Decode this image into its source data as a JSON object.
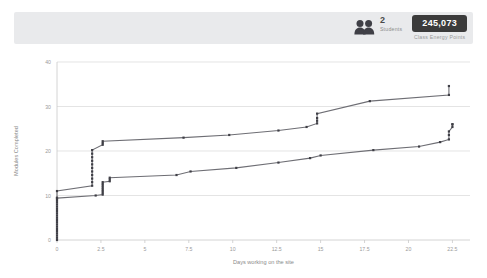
{
  "stats": {
    "students": {
      "value": "2",
      "label": "Students",
      "icon": "people-icon"
    },
    "energy_points": {
      "value": "245,073",
      "label": "Class Energy Points"
    }
  },
  "chart_data": {
    "type": "line",
    "title": "",
    "xlabel": "Days working on the site",
    "ylabel": "Modules Completed",
    "xlim": [
      0,
      23.5
    ],
    "ylim": [
      0,
      40
    ],
    "xticks": [
      "0",
      "2.5",
      "5",
      "7.5",
      "10",
      "12.5",
      "15",
      "17.5",
      "20",
      "22.5"
    ],
    "xtick_values": [
      0,
      2.5,
      5,
      7.5,
      10,
      12.5,
      15,
      17.5,
      20,
      22.5
    ],
    "yticks": [
      "0",
      "10",
      "20",
      "30",
      "40"
    ],
    "ytick_values": [
      0,
      10,
      20,
      30,
      40
    ],
    "grid": true,
    "legend": "none",
    "line_color": "#6e6e74",
    "marker_color": "#3f3f46",
    "series": [
      {
        "name": "Student 1",
        "x": [
          0,
          0,
          0,
          0,
          0,
          0,
          0,
          0,
          0,
          0,
          0,
          0,
          0,
          0,
          0,
          0,
          0,
          0,
          0,
          0,
          0,
          2.0,
          2.0,
          2.0,
          2.0,
          2.0,
          2.0,
          2.0,
          2.0,
          2.0,
          2.0,
          2.0,
          2.6,
          2.6,
          2.6,
          7.2,
          9.8,
          12.6,
          14.2,
          14.8,
          14.8,
          14.8,
          14.8,
          17.8,
          22.3
        ],
        "y": [
          0,
          0.5,
          1,
          1.5,
          2,
          2.5,
          3,
          3.5,
          4,
          4.5,
          5,
          5.5,
          6,
          6.5,
          7,
          7.5,
          8,
          8.5,
          9,
          9.5,
          11,
          12.2,
          13,
          13.8,
          14.6,
          15.4,
          16.2,
          17,
          17.8,
          18.6,
          19.4,
          20.2,
          21.4,
          21.8,
          22.2,
          23.0,
          23.6,
          24.6,
          25.4,
          26.2,
          26.8,
          27.4,
          28.4,
          31.2,
          32.6
        ],
        "final_value": 34.6
      },
      {
        "name": "Student 2",
        "x": [
          0,
          2.2,
          2.6,
          2.6,
          2.6,
          2.6,
          2.6,
          2.6,
          2.6,
          2.6,
          3.0,
          3.0,
          3.0,
          6.8,
          7.6,
          10.2,
          12.6,
          14.4,
          15.0,
          18.0,
          20.6,
          21.8,
          22.3,
          22.3,
          22.3,
          22.5,
          22.5
        ],
        "y": [
          9.4,
          10.0,
          10.2,
          10.6,
          11.0,
          11.4,
          11.8,
          12.2,
          12.6,
          13.0,
          13.2,
          13.6,
          14.0,
          14.6,
          15.4,
          16.2,
          17.4,
          18.4,
          19.0,
          20.2,
          21.0,
          22.0,
          22.6,
          23.6,
          24.4,
          25.4,
          26.0
        ],
        "final_value": 26.0
      }
    ]
  }
}
